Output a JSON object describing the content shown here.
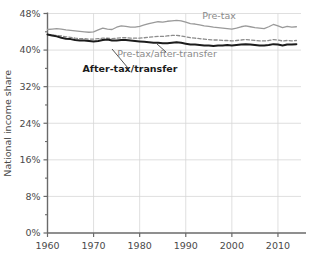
{
  "chart_data": {
    "type": "line",
    "title": "",
    "xlabel": "",
    "ylabel": "National income share",
    "xlim": [
      1960,
      2015
    ],
    "ylim": [
      0,
      48
    ],
    "grid": true,
    "legend_position": "inline-annotations",
    "yticks": [
      "0%",
      "8%",
      "16%",
      "24%",
      "32%",
      "40%",
      "48%"
    ],
    "ytick_values": [
      0,
      8,
      16,
      24,
      32,
      40,
      48
    ],
    "yminor_values": [
      4,
      12,
      20,
      28,
      36,
      44
    ],
    "xticks": [
      "1960",
      "1970",
      "1980",
      "1990",
      "2000",
      "2010"
    ],
    "xtick_values": [
      1960,
      1970,
      1980,
      1990,
      2000,
      2010
    ],
    "x": [
      1960,
      1961,
      1962,
      1963,
      1964,
      1965,
      1966,
      1967,
      1968,
      1969,
      1970,
      1971,
      1972,
      1973,
      1974,
      1975,
      1976,
      1977,
      1978,
      1979,
      1980,
      1981,
      1982,
      1983,
      1984,
      1985,
      1986,
      1987,
      1988,
      1989,
      1990,
      1991,
      1992,
      1993,
      1994,
      1995,
      1996,
      1997,
      1998,
      1999,
      2000,
      2001,
      2002,
      2003,
      2004,
      2005,
      2006,
      2007,
      2008,
      2009,
      2010,
      2011,
      2012,
      2013,
      2014
    ],
    "series": [
      {
        "name": "Pre-tax",
        "label": "Pre-tax",
        "color": "#9a9a9a",
        "style": "solid",
        "width": 1.3,
        "values": [
          44.5,
          44.6,
          44.7,
          44.6,
          44.4,
          44.3,
          44.2,
          44.1,
          44.0,
          43.9,
          44.0,
          44.4,
          44.8,
          44.6,
          44.5,
          45.0,
          45.3,
          45.2,
          45.0,
          45.0,
          45.2,
          45.5,
          45.8,
          46.0,
          46.2,
          46.1,
          46.3,
          46.4,
          46.5,
          46.4,
          46.1,
          45.8,
          45.7,
          45.5,
          45.3,
          45.2,
          45.0,
          44.9,
          44.8,
          44.7,
          44.6,
          44.8,
          45.1,
          45.3,
          45.1,
          44.9,
          44.8,
          44.7,
          45.1,
          45.6,
          45.3,
          44.9,
          45.2,
          45.0,
          45.1
        ]
      },
      {
        "name": "Pre-tax/after-transfer",
        "label": "Pre-tax/after-transfer",
        "color": "#8c8c8c",
        "style": "dashed",
        "width": 1.3,
        "values": [
          43.4,
          43.3,
          43.2,
          43.1,
          42.9,
          42.8,
          42.6,
          42.5,
          42.5,
          42.4,
          42.4,
          42.5,
          42.6,
          42.6,
          42.5,
          42.6,
          42.7,
          42.7,
          42.6,
          42.6,
          42.6,
          42.7,
          42.8,
          42.9,
          43.0,
          43.0,
          43.1,
          43.2,
          43.2,
          43.1,
          42.9,
          42.7,
          42.6,
          42.5,
          42.4,
          42.3,
          42.2,
          42.2,
          42.1,
          42.1,
          42.0,
          42.1,
          42.2,
          42.3,
          42.2,
          42.1,
          42.0,
          42.0,
          42.1,
          42.3,
          42.2,
          42.0,
          42.1,
          42.0,
          42.1
        ]
      },
      {
        "name": "After-tax/transfer",
        "label": "After-tax/transfer",
        "color": "#1c1c1c",
        "style": "solid",
        "width": 2.0,
        "values": [
          43.4,
          43.2,
          43.0,
          42.7,
          42.5,
          42.4,
          42.2,
          42.1,
          42.1,
          42.0,
          41.9,
          42.0,
          42.2,
          42.3,
          42.1,
          42.1,
          42.2,
          42.2,
          42.1,
          42.0,
          41.9,
          41.8,
          41.7,
          41.6,
          41.6,
          41.5,
          41.5,
          41.6,
          41.7,
          41.6,
          41.4,
          41.2,
          41.2,
          41.1,
          41.0,
          41.0,
          40.9,
          41.0,
          41.0,
          41.1,
          41.0,
          41.1,
          41.2,
          41.3,
          41.2,
          41.1,
          41.0,
          41.0,
          41.1,
          41.3,
          41.2,
          41.0,
          41.2,
          41.2,
          41.3
        ]
      }
    ],
    "annotations": [
      {
        "name": "pre-tax-annotation",
        "text": "Pre-tax",
        "x": 219,
        "y": 19,
        "color": "#8a8a8a",
        "bold": false
      },
      {
        "name": "pre-tax-after-transfer-annotation",
        "text": "Pre-tax/after-transfer",
        "x": 167,
        "y": 57,
        "color": "#8a8a8a",
        "bold": false
      },
      {
        "name": "after-tax-transfer-annotation",
        "text": "After-tax/transfer",
        "x": 130,
        "y": 72,
        "color": "#1c1c1c",
        "bold": true
      }
    ],
    "leader_lines": [
      {
        "name": "leader-after-tax",
        "x1": 128,
        "y1": 68,
        "x2": 112,
        "y2": 49
      },
      {
        "name": "leader-pre-tax-after-transfer",
        "x1": 166,
        "y1": 52,
        "x2": 157,
        "y2": 44
      }
    ],
    "colors": {
      "axis": "#6a6a6a",
      "grid": "#d7d7d7",
      "pre_tax": "#9a9a9a",
      "pre_tax_after_transfer": "#8c8c8c",
      "after_tax_transfer": "#1c1c1c",
      "text": "#4a4a4a"
    }
  }
}
